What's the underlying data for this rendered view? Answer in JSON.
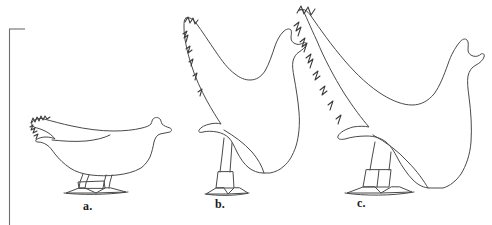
{
  "figure": {
    "kind": "line-drawing",
    "background_color": "#ffffff",
    "stroke_color": "#4a4a4a",
    "label_color": "#1a1a1a",
    "frame": {
      "present": true,
      "description": "partial rectangular rule at left edge",
      "color": "#6e6e6e"
    },
    "panels": [
      {
        "id": "a",
        "label": "a.",
        "name": "hen-outline-horizontal",
        "posture": "low, horizontal back",
        "relative_size": "small"
      },
      {
        "id": "b",
        "label": "b.",
        "name": "hen-outline-upright",
        "posture": "tall, upright, long legs",
        "relative_size": "medium"
      },
      {
        "id": "c",
        "label": "c.",
        "name": "hen-outline-large-upright",
        "posture": "tall, broad body, upright",
        "relative_size": "large"
      }
    ]
  }
}
